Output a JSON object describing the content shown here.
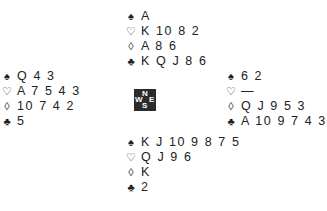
{
  "suits": {
    "spades": "♠",
    "hearts": "♡",
    "diamonds": "◊",
    "clubs": "♣"
  },
  "hands": {
    "north": {
      "spades": "A",
      "hearts": "K 10 8 2",
      "diamonds": "A 8 6",
      "clubs": "K Q J 8 6"
    },
    "west": {
      "spades": "Q 4 3",
      "hearts": "A 7 5 4 3",
      "diamonds": "10 7 4 2",
      "clubs": "5"
    },
    "east": {
      "spades": "6 2",
      "hearts": "—",
      "diamonds": "Q J 9 5 3",
      "clubs": "A 10 9 7 4 3"
    },
    "south": {
      "spades": "K J 10 9 8 7 5",
      "hearts": "Q J 9 6",
      "diamonds": "K",
      "clubs": "2"
    }
  },
  "compass": {
    "n": "N",
    "s": "S",
    "e": "E",
    "w": "W"
  }
}
